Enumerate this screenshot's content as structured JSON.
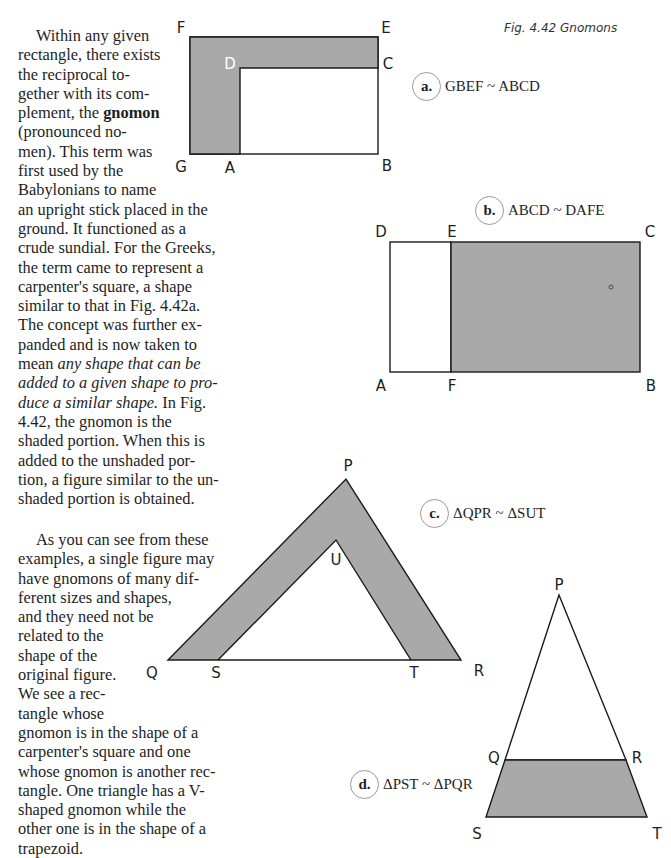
{
  "text": {
    "lines": [
      "Within any given",
      "rectangle, there exists",
      "the reciprocal to-",
      "gether with its com-",
      "plement, the ",
      "gnomon",
      "(pronounced no-",
      "men). This term was",
      "first used by the",
      "Babylonians to name",
      "an upright stick placed in the",
      "ground. It functioned as a",
      "crude sundial. For the Greeks,",
      "the term came to represent a",
      "carpenter's square, a shape",
      "similar to that in Fig. 4.42a.",
      "The concept was further ex-",
      "panded and is now taken to",
      "mean ",
      "any shape that can be",
      "added to a given shape to pro-",
      "duce a similar shape.",
      " In Fig.",
      "4.42, the gnomon is the",
      "shaded portion. When this is",
      "added to the unshaded por-",
      "tion, a figure similar to the un-",
      "shaded portion is obtained."
    ],
    "para2": [
      "As you can see from these",
      "examples, a single figure may",
      "have gnomons of many dif-",
      "ferent sizes and shapes,",
      "and they need not be",
      "related to the",
      "shape of the",
      "original figure.",
      "We see a rec-",
      "tangle whose",
      "gnomon is in the shape of a",
      "carpenter's square and one",
      "whose gnomon is another rec-",
      "tangle. One triangle has a V-",
      "shaped gnomon while the",
      "other one is in the shape of a",
      "trapezoid."
    ]
  },
  "figure": {
    "caption": "Fig. 4.42  Gnomons",
    "shade_color": "#a9a9a9",
    "stroke_color": "#1a1a1a",
    "a": {
      "tag": "a.",
      "relation": "GBEF ~ ABCD",
      "labels": {
        "F": "F",
        "E": "E",
        "D": "D",
        "C": "C",
        "G": "G",
        "A": "A",
        "B": "B"
      }
    },
    "b": {
      "tag": "b.",
      "relation": "ABCD ~ DAFE",
      "labels": {
        "D": "D",
        "E": "E",
        "C": "C",
        "A": "A",
        "F": "F",
        "B": "B"
      }
    },
    "c": {
      "tag": "c.",
      "relation": "ΔQPR ~ ΔSUT",
      "labels": {
        "P": "P",
        "U": "U",
        "Q": "Q",
        "S": "S",
        "T": "T",
        "R": "R"
      }
    },
    "d": {
      "tag": "d.",
      "relation": "ΔPST ~ ΔPQR",
      "labels": {
        "P": "P",
        "Q": "Q",
        "R": "R",
        "S": "S",
        "T": "T"
      }
    }
  }
}
